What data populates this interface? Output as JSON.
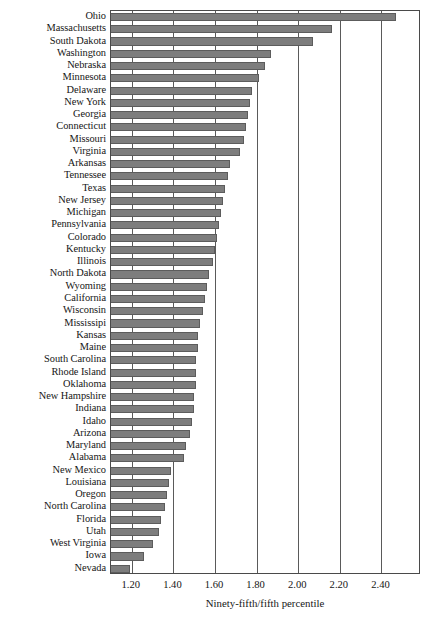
{
  "chart_data": {
    "type": "bar",
    "orientation": "horizontal",
    "title": "",
    "xlabel": "Ninety-fifth/fifth percentile",
    "ylabel": "",
    "xlim": [
      1.1,
      2.59
    ],
    "xticks": [
      "1.20",
      "1.40",
      "1.60",
      "1.80",
      "2.00",
      "2.20",
      "2.40"
    ],
    "xtick_values": [
      1.2,
      1.4,
      1.6,
      1.8,
      2.0,
      2.2,
      2.4
    ],
    "grid": "vertical",
    "legend": "none",
    "bar_color": "#7d7d7d",
    "bar_edge_color": "#5c5c5c",
    "frame_color": "#4a4a4a",
    "categories": [
      "Ohio",
      "Massachusetts",
      "South Dakota",
      "Washington",
      "Nebraska",
      "Minnesota",
      "Delaware",
      "New York",
      "Georgia",
      "Connecticut",
      "Missouri",
      "Virginia",
      "Arkansas",
      "Tennessee",
      "Texas",
      "New Jersey",
      "Michigan",
      "Pennsylvania",
      "Colorado",
      "Kentucky",
      "Illinois",
      "North Dakota",
      "Wyoming",
      "California",
      "Wisconsin",
      "Mississipi",
      "Kansas",
      "Maine",
      "South Carolina",
      "Rhode Island",
      "Oklahoma",
      "New Hampshire",
      "Indiana",
      "Idaho",
      "Arizona",
      "Maryland",
      "Alabama",
      "New Mexico",
      "Louisiana",
      "Oregon",
      "North Carolina",
      "Florida",
      "Utah",
      "West Virginia",
      "Iowa",
      "Nevada"
    ],
    "values": [
      2.47,
      2.16,
      2.07,
      1.87,
      1.84,
      1.81,
      1.78,
      1.77,
      1.76,
      1.75,
      1.74,
      1.72,
      1.67,
      1.66,
      1.65,
      1.64,
      1.63,
      1.62,
      1.61,
      1.6,
      1.59,
      1.57,
      1.56,
      1.55,
      1.54,
      1.53,
      1.52,
      1.52,
      1.51,
      1.51,
      1.51,
      1.5,
      1.5,
      1.49,
      1.48,
      1.46,
      1.45,
      1.39,
      1.38,
      1.37,
      1.36,
      1.34,
      1.33,
      1.3,
      1.26,
      1.19
    ]
  }
}
